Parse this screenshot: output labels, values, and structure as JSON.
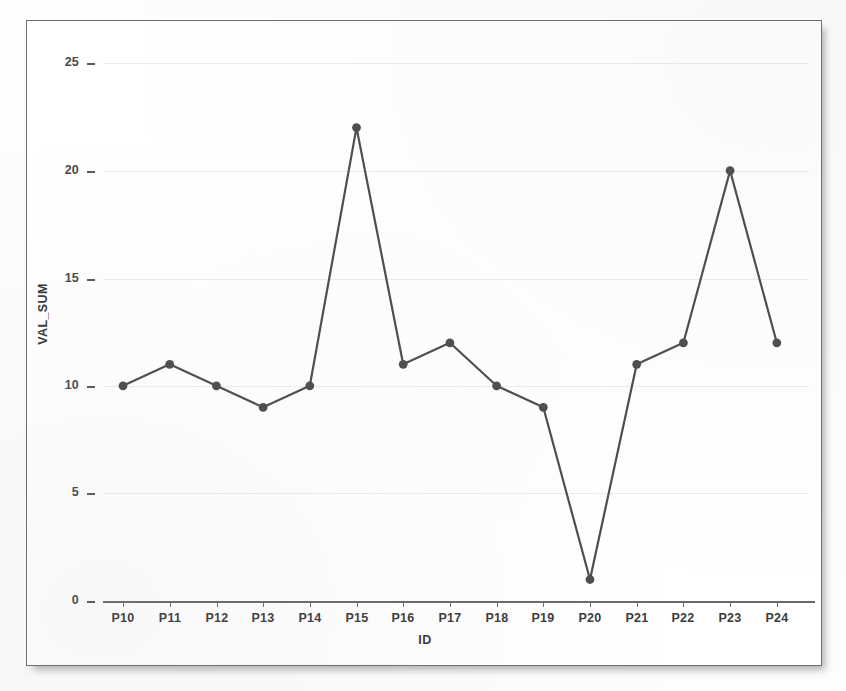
{
  "chart_data": {
    "type": "line",
    "title": "",
    "subtitle": "",
    "xlabel": "ID",
    "ylabel": "VAL_SUM",
    "categories": [
      "P10",
      "P11",
      "P12",
      "P13",
      "P14",
      "P15",
      "P16",
      "P17",
      "P18",
      "P19",
      "P20",
      "P21",
      "P22",
      "P23",
      "P24"
    ],
    "values": [
      10,
      11,
      10,
      9,
      10,
      22,
      11,
      12,
      10,
      9,
      1,
      11,
      12,
      20,
      12
    ],
    "series": [
      {
        "name": "VAL_SUM",
        "values": [
          10,
          11,
          10,
          9,
          10,
          22,
          11,
          12,
          10,
          9,
          1,
          11,
          12,
          20,
          12
        ]
      }
    ],
    "ylim": [
      0,
      26.5
    ],
    "y_ticks": [
      0,
      5,
      10,
      15,
      20,
      25
    ],
    "y_tick_labels": [
      "0",
      "5",
      "10",
      "15",
      "20",
      "25"
    ],
    "x_ticks": [
      "P10",
      "P11",
      "P12",
      "P13",
      "P14",
      "P15",
      "P16",
      "P17",
      "P18",
      "P19",
      "P20",
      "P21",
      "P22",
      "P23",
      "P24"
    ],
    "grid": "horizontal",
    "legend": "none",
    "markers": "filled-circle",
    "line_color": "#4d4d50",
    "marker_color": "#4d4d50",
    "grid_color": "#ececee",
    "axis_color": "#6a6a6c",
    "background_color": "#ffffff",
    "frame_border_color": "#6e6e70"
  },
  "axes": {
    "y_title": "VAL_SUM",
    "x_title": "ID"
  }
}
